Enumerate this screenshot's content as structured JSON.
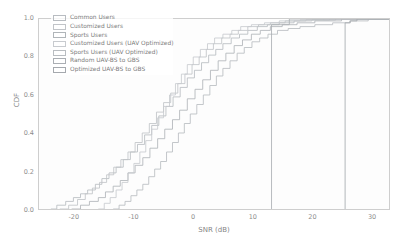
{
  "chart_data": {
    "type": "line",
    "title": "",
    "xlabel": "SNR (dB)",
    "ylabel": "CDF",
    "xlim": [
      -26,
      33
    ],
    "ylim": [
      0,
      1.0
    ],
    "xticks": [
      -20,
      -10,
      0,
      10,
      20,
      30
    ],
    "xtick_labels": [
      "-20",
      "-10",
      "0",
      "10",
      "20",
      "30"
    ],
    "yticks": [
      0.0,
      0.2,
      0.4,
      0.6,
      0.8,
      1.0
    ],
    "ytick_labels": [
      "0.0",
      "0.2",
      "0.4",
      "0.6",
      "0.8",
      "1.0"
    ],
    "grid": false,
    "legend_position": "upper-left",
    "series": [
      {
        "name": "Common Users",
        "color": "#9aa0a6",
        "points": [
          [
            -24.0,
            0.0
          ],
          [
            -23.0,
            0.02
          ],
          [
            -21.5,
            0.04
          ],
          [
            -20.2,
            0.06
          ],
          [
            -19.0,
            0.08
          ],
          [
            -17.8,
            0.1
          ],
          [
            -16.5,
            0.13
          ],
          [
            -15.4,
            0.16
          ],
          [
            -14.2,
            0.19
          ],
          [
            -13.0,
            0.22
          ],
          [
            -11.8,
            0.26
          ],
          [
            -10.6,
            0.3
          ],
          [
            -9.4,
            0.34
          ],
          [
            -8.2,
            0.39
          ],
          [
            -7.0,
            0.44
          ],
          [
            -5.8,
            0.49
          ],
          [
            -4.6,
            0.54
          ],
          [
            -3.4,
            0.59
          ],
          [
            -2.2,
            0.64
          ],
          [
            -1.0,
            0.69
          ],
          [
            0.2,
            0.73
          ],
          [
            1.4,
            0.77
          ],
          [
            2.6,
            0.81
          ],
          [
            3.8,
            0.84
          ],
          [
            5.0,
            0.87
          ],
          [
            6.4,
            0.9
          ],
          [
            7.8,
            0.92
          ],
          [
            9.2,
            0.94
          ],
          [
            10.8,
            0.96
          ],
          [
            12.5,
            0.97
          ],
          [
            14.5,
            0.98
          ],
          [
            17.0,
            0.99
          ],
          [
            20.0,
            0.995
          ],
          [
            24.0,
            1.0
          ],
          [
            33.0,
            1.0
          ]
        ]
      },
      {
        "name": "Customized Users",
        "color": "#a6abb0",
        "points": [
          [
            -22.5,
            0.0
          ],
          [
            -21.0,
            0.02
          ],
          [
            -19.5,
            0.05
          ],
          [
            -18.2,
            0.08
          ],
          [
            -17.0,
            0.11
          ],
          [
            -15.8,
            0.14
          ],
          [
            -14.6,
            0.18
          ],
          [
            -13.4,
            0.22
          ],
          [
            -12.2,
            0.26
          ],
          [
            -11.0,
            0.3
          ],
          [
            -9.8,
            0.35
          ],
          [
            -8.6,
            0.4
          ],
          [
            -7.4,
            0.45
          ],
          [
            -6.2,
            0.51
          ],
          [
            -5.0,
            0.56
          ],
          [
            -3.8,
            0.61
          ],
          [
            -2.6,
            0.66
          ],
          [
            -1.4,
            0.71
          ],
          [
            -0.2,
            0.76
          ],
          [
            1.0,
            0.8
          ],
          [
            2.2,
            0.84
          ],
          [
            3.4,
            0.87
          ],
          [
            4.8,
            0.9
          ],
          [
            6.2,
            0.92
          ],
          [
            7.6,
            0.94
          ],
          [
            9.2,
            0.96
          ],
          [
            11.0,
            0.97
          ],
          [
            13.0,
            0.98
          ],
          [
            15.5,
            0.99
          ],
          [
            19.0,
            0.995
          ],
          [
            23.0,
            1.0
          ],
          [
            33.0,
            1.0
          ]
        ]
      },
      {
        "name": "Sports Users",
        "color": "#8f959b",
        "points": [
          [
            -20.5,
            0.0
          ],
          [
            -19.0,
            0.02
          ],
          [
            -17.5,
            0.04
          ],
          [
            -16.0,
            0.06
          ],
          [
            -14.8,
            0.09
          ],
          [
            -13.5,
            0.12
          ],
          [
            -12.3,
            0.15
          ],
          [
            -11.0,
            0.19
          ],
          [
            -9.8,
            0.23
          ],
          [
            -8.5,
            0.27
          ],
          [
            -7.3,
            0.32
          ],
          [
            -6.0,
            0.37
          ],
          [
            -4.8,
            0.42
          ],
          [
            -3.5,
            0.47
          ],
          [
            -2.3,
            0.52
          ],
          [
            -1.0,
            0.58
          ],
          [
            0.3,
            0.63
          ],
          [
            1.6,
            0.68
          ],
          [
            2.9,
            0.73
          ],
          [
            4.2,
            0.78
          ],
          [
            5.5,
            0.82
          ],
          [
            6.9,
            0.86
          ],
          [
            8.3,
            0.89
          ],
          [
            9.8,
            0.92
          ],
          [
            11.3,
            0.94
          ],
          [
            13.0,
            0.96
          ],
          [
            15.0,
            0.97
          ],
          [
            17.5,
            0.98
          ],
          [
            20.5,
            0.99
          ],
          [
            25.0,
            1.0
          ],
          [
            33.0,
            1.0
          ]
        ]
      },
      {
        "name": "Customized Users (UAV Optimized)",
        "color": "#b0b5ba",
        "points": [
          [
            -16.0,
            0.0
          ],
          [
            -15.0,
            0.03
          ],
          [
            -14.0,
            0.06
          ],
          [
            -13.0,
            0.1
          ],
          [
            -12.0,
            0.14
          ],
          [
            -11.0,
            0.19
          ],
          [
            -10.0,
            0.24
          ],
          [
            -9.0,
            0.3
          ],
          [
            -8.0,
            0.36
          ],
          [
            -7.0,
            0.42
          ],
          [
            -6.0,
            0.48
          ],
          [
            -5.0,
            0.54
          ],
          [
            -4.0,
            0.6
          ],
          [
            -3.0,
            0.66
          ],
          [
            -2.0,
            0.71
          ],
          [
            -1.0,
            0.76
          ],
          [
            0.0,
            0.8
          ],
          [
            1.2,
            0.84
          ],
          [
            2.4,
            0.87
          ],
          [
            3.6,
            0.9
          ],
          [
            5.0,
            0.92
          ],
          [
            6.5,
            0.94
          ],
          [
            8.0,
            0.96
          ],
          [
            9.8,
            0.97
          ],
          [
            12.0,
            0.98
          ],
          [
            14.5,
            0.99
          ],
          [
            18.0,
            0.995
          ],
          [
            22.0,
            1.0
          ],
          [
            33.0,
            1.0
          ]
        ]
      },
      {
        "name": "Sports Users (UAV Optimized)",
        "color": "#9ba1a7",
        "points": [
          [
            -13.5,
            0.0
          ],
          [
            -12.5,
            0.02
          ],
          [
            -11.5,
            0.04
          ],
          [
            -10.5,
            0.07
          ],
          [
            -9.5,
            0.1
          ],
          [
            -8.5,
            0.13
          ],
          [
            -7.5,
            0.17
          ],
          [
            -6.5,
            0.21
          ],
          [
            -5.5,
            0.25
          ],
          [
            -4.5,
            0.3
          ],
          [
            -3.5,
            0.35
          ],
          [
            -2.5,
            0.4
          ],
          [
            -1.5,
            0.45
          ],
          [
            -0.5,
            0.5
          ],
          [
            0.6,
            0.55
          ],
          [
            1.7,
            0.6
          ],
          [
            2.8,
            0.65
          ],
          [
            3.9,
            0.7
          ],
          [
            5.0,
            0.74
          ],
          [
            6.2,
            0.78
          ],
          [
            7.4,
            0.82
          ],
          [
            8.6,
            0.85
          ],
          [
            9.9,
            0.88
          ],
          [
            11.2,
            0.9
          ],
          [
            12.6,
            0.92
          ],
          [
            14.2,
            0.94
          ],
          [
            16.0,
            0.95
          ],
          [
            18.0,
            0.96
          ],
          [
            20.5,
            0.97
          ],
          [
            23.5,
            0.98
          ],
          [
            26.5,
            0.99
          ],
          [
            29.5,
            1.0
          ],
          [
            33.0,
            1.0
          ]
        ]
      },
      {
        "name": "Random UAV-BS to GBS",
        "color": "#868c92",
        "points": [
          [
            13.2,
            0.0
          ],
          [
            13.2,
            0.97
          ],
          [
            16.2,
            0.97
          ],
          [
            16.2,
            1.0
          ],
          [
            33.0,
            1.0
          ]
        ]
      },
      {
        "name": "Optimized UAV-BS to GBS",
        "color": "#7e858b",
        "points": [
          [
            25.6,
            0.0
          ],
          [
            25.6,
            0.98
          ],
          [
            26.4,
            0.98
          ],
          [
            26.4,
            0.99
          ],
          [
            27.6,
            0.99
          ],
          [
            27.6,
            1.0
          ],
          [
            30.8,
            1.0
          ],
          [
            33.0,
            1.0
          ]
        ]
      }
    ]
  },
  "legend": {
    "items": [
      "Common Users",
      "Customized Users",
      "Sports Users",
      "Customized Users (UAV Optimized)",
      "Sports Users (UAV Optimized)",
      "Random UAV-BS to GBS",
      "Optimized UAV-BS to GBS"
    ]
  }
}
